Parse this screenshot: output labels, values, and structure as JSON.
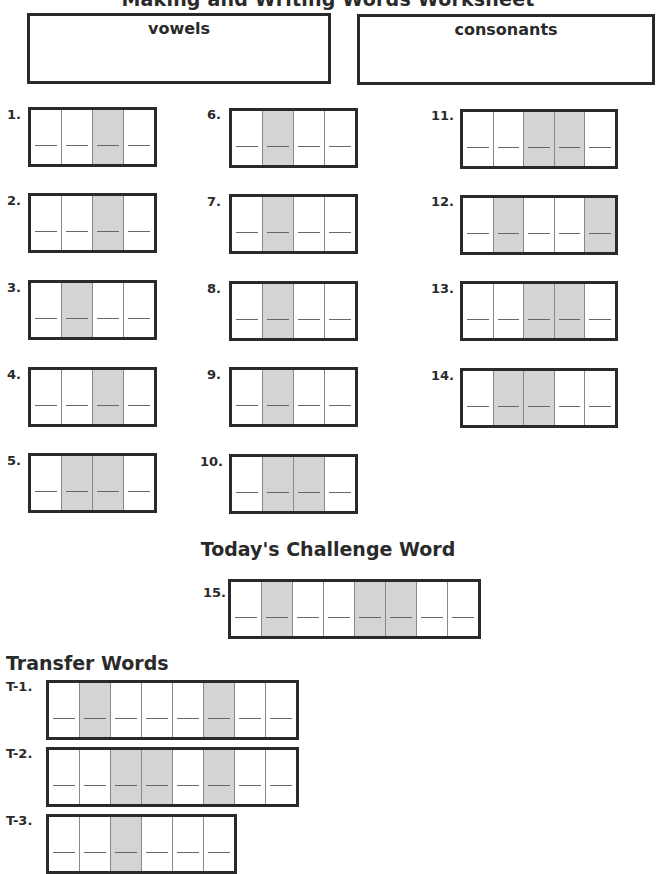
{
  "title": "Making and Writing Words Worksheet",
  "sort_boxes": {
    "vowels": {
      "label": "vowels"
    },
    "consonants": {
      "label": "consonants"
    }
  },
  "words": [
    {
      "number": "1.",
      "cells": 4,
      "shaded": [
        3
      ]
    },
    {
      "number": "2.",
      "cells": 4,
      "shaded": [
        3
      ]
    },
    {
      "number": "3.",
      "cells": 4,
      "shaded": [
        2
      ]
    },
    {
      "number": "4.",
      "cells": 4,
      "shaded": [
        3
      ]
    },
    {
      "number": "5.",
      "cells": 4,
      "shaded": [
        2,
        3
      ]
    },
    {
      "number": "6.",
      "cells": 4,
      "shaded": [
        2
      ]
    },
    {
      "number": "7.",
      "cells": 4,
      "shaded": [
        2
      ]
    },
    {
      "number": "8.",
      "cells": 4,
      "shaded": [
        2
      ]
    },
    {
      "number": "9.",
      "cells": 4,
      "shaded": [
        2
      ]
    },
    {
      "number": "10.",
      "cells": 4,
      "shaded": [
        2,
        3
      ]
    },
    {
      "number": "11.",
      "cells": 5,
      "shaded": [
        3,
        4
      ]
    },
    {
      "number": "12.",
      "cells": 5,
      "shaded": [
        2,
        5
      ]
    },
    {
      "number": "13.",
      "cells": 5,
      "shaded": [
        3,
        4
      ]
    },
    {
      "number": "14.",
      "cells": 5,
      "shaded": [
        2,
        3
      ]
    }
  ],
  "challenge": {
    "heading": "Today's Challenge Word",
    "word": {
      "number": "15.",
      "cells": 8,
      "shaded": [
        2,
        5,
        6
      ]
    }
  },
  "transfer": {
    "heading": "Transfer Words",
    "words": [
      {
        "number": "T-1.",
        "cells": 8,
        "shaded": [
          2,
          6
        ]
      },
      {
        "number": "T-2.",
        "cells": 8,
        "shaded": [
          3,
          4,
          6
        ]
      },
      {
        "number": "T-3.",
        "cells": 6,
        "shaded": [
          3
        ]
      }
    ]
  },
  "colors": {
    "border": "#2a2a2a",
    "shaded_cell": "#d4d4d4",
    "writing_line": "#666666"
  }
}
